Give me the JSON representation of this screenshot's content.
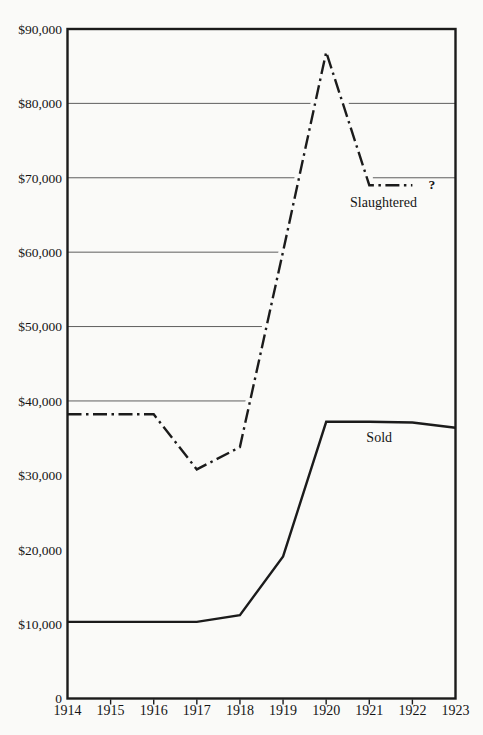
{
  "chart_data": {
    "type": "line",
    "x_range": [
      1914,
      1923
    ],
    "ylim": [
      0,
      90000
    ],
    "xlabel": "",
    "ylabel": "",
    "grid": "partial-horizontal",
    "legend_position": "inline-labels",
    "categories": [
      1914,
      1915,
      1916,
      1917,
      1918,
      1919,
      1920,
      1921,
      1922,
      1923
    ],
    "x_tick_labels": [
      "1914",
      "1915",
      "1916",
      "1917",
      "1918",
      "1919",
      "1920",
      "1921",
      "1922",
      "1923"
    ],
    "series": [
      {
        "name": "Slaughtered",
        "style": "dashdot",
        "values": [
          38200,
          38200,
          38200,
          30800,
          33800,
          60100,
          86900,
          69000,
          69000,
          null
        ],
        "note": "1923 value unknown, shown as ?"
      },
      {
        "name": "Sold",
        "style": "solid",
        "values": [
          10300,
          10300,
          10300,
          10300,
          11200,
          19100,
          37200,
          37200,
          37100,
          36400
        ]
      }
    ],
    "y_ticks": [
      {
        "value": 90000,
        "label": "$90,000"
      },
      {
        "value": 80000,
        "label": "$80,000"
      },
      {
        "value": 70000,
        "label": "$70,000"
      },
      {
        "value": 60000,
        "label": "$60,000"
      },
      {
        "value": 50000,
        "label": "$50,000"
      },
      {
        "value": 40000,
        "label": "$40,000"
      },
      {
        "value": 30000,
        "label": "$30,000"
      },
      {
        "value": 20000,
        "label": "$20,000"
      },
      {
        "value": 10000,
        "label": "$10,000"
      },
      {
        "value": 0,
        "label": "0"
      }
    ],
    "gridlines": [
      {
        "value": 80000,
        "extent": "split"
      },
      {
        "value": 70000,
        "extent": "split"
      },
      {
        "value": 60000,
        "extent": "left_only"
      },
      {
        "value": 50000,
        "extent": "left_only"
      },
      {
        "value": 40000,
        "extent": "left_only"
      }
    ],
    "annotations": [
      {
        "text": "Slaughtered",
        "x": 1921.33,
        "y": 66100,
        "anchor": "middle",
        "bold": false
      },
      {
        "text": "Sold",
        "x": 1921.23,
        "y": 34500,
        "anchor": "middle",
        "bold": false
      },
      {
        "text": "?",
        "x": 1922.45,
        "y": 68500,
        "anchor": "middle",
        "bold": true
      }
    ],
    "colors": {
      "line": "#1b1b1b",
      "gridline": "#4d4d4d",
      "background": "#fafaf8"
    }
  }
}
